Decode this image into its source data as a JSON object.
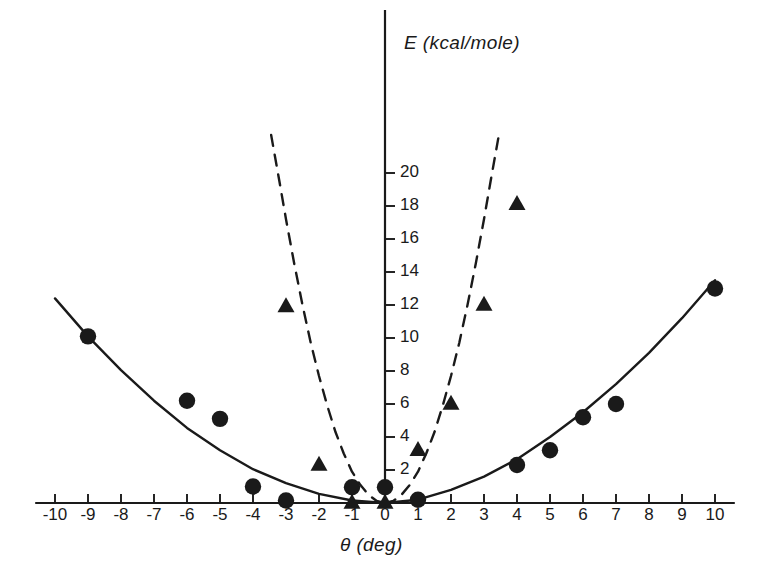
{
  "chart_data": {
    "type": "scatter",
    "title": "",
    "xlabel": "θ (deg)",
    "ylabel": "E (kcal/mole)",
    "xlim": [
      -10.6,
      10.6
    ],
    "ylim": [
      0,
      22.5
    ],
    "grid": false,
    "legend_position": "none",
    "x_ticks": [
      -10,
      -9,
      -8,
      -7,
      -6,
      -5,
      -4,
      -3,
      -2,
      -1,
      0,
      1,
      2,
      3,
      4,
      5,
      6,
      7,
      8,
      9,
      10
    ],
    "x_tick_labels": [
      "-10",
      "-9",
      "-8",
      "-7",
      "-6",
      "-5",
      "-4",
      "-3",
      "-2",
      "-1",
      "0",
      "1",
      "2",
      "3",
      "4",
      "5",
      "6",
      "7",
      "8",
      "9",
      "10"
    ],
    "y_ticks": [
      2,
      4,
      6,
      8,
      10,
      12,
      14,
      16,
      18,
      20
    ],
    "y_tick_labels": [
      "2",
      "4",
      "6",
      "8",
      "10",
      "12",
      "14",
      "16",
      "18",
      "20"
    ],
    "series": [
      {
        "name": "circles",
        "marker": "filled-circle",
        "color": "#1a1a1a",
        "points": [
          {
            "x": -9,
            "y": 10.1
          },
          {
            "x": -6,
            "y": 6.2
          },
          {
            "x": -5,
            "y": 5.1
          },
          {
            "x": -4,
            "y": 1.0
          },
          {
            "x": -3,
            "y": 0.15
          },
          {
            "x": -1,
            "y": 0.95
          },
          {
            "x": 0,
            "y": 0.95
          },
          {
            "x": 1,
            "y": 0.2
          },
          {
            "x": 4,
            "y": 2.3
          },
          {
            "x": 5,
            "y": 3.2
          },
          {
            "x": 6,
            "y": 5.2
          },
          {
            "x": 7,
            "y": 6.0
          },
          {
            "x": 10,
            "y": 13.0
          }
        ]
      },
      {
        "name": "triangles",
        "marker": "filled-triangle",
        "color": "#1a1a1a",
        "points": [
          {
            "x": -3,
            "y": 11.9
          },
          {
            "x": -2,
            "y": 2.3
          },
          {
            "x": -1,
            "y": 0.0
          },
          {
            "x": 0,
            "y": 0.0
          },
          {
            "x": 1,
            "y": 3.2
          },
          {
            "x": 2,
            "y": 6.0
          },
          {
            "x": 3,
            "y": 12.0
          },
          {
            "x": 4,
            "y": 18.1
          }
        ]
      },
      {
        "name": "solid-curve",
        "marker": "none",
        "line_style": "solid",
        "color": "#1a1a1a",
        "description": "broad quadratic fit through circle data",
        "points": [
          {
            "x": -10.0,
            "y": 12.4
          },
          {
            "x": -9.0,
            "y": 10.1
          },
          {
            "x": -8.0,
            "y": 8.05
          },
          {
            "x": -7.0,
            "y": 6.2
          },
          {
            "x": -6.0,
            "y": 4.55
          },
          {
            "x": -5.0,
            "y": 3.2
          },
          {
            "x": -4.0,
            "y": 2.05
          },
          {
            "x": -3.0,
            "y": 1.2
          },
          {
            "x": -2.0,
            "y": 0.55
          },
          {
            "x": -1.0,
            "y": 0.15
          },
          {
            "x": 0.0,
            "y": 0.0
          },
          {
            "x": 1.0,
            "y": 0.2
          },
          {
            "x": 2.0,
            "y": 0.8
          },
          {
            "x": 3.0,
            "y": 1.6
          },
          {
            "x": 4.0,
            "y": 2.65
          },
          {
            "x": 5.0,
            "y": 4.0
          },
          {
            "x": 6.0,
            "y": 5.5
          },
          {
            "x": 7.0,
            "y": 7.2
          },
          {
            "x": 8.0,
            "y": 9.1
          },
          {
            "x": 9.0,
            "y": 11.2
          },
          {
            "x": 10.0,
            "y": 13.5
          }
        ]
      },
      {
        "name": "dashed-curve-left",
        "marker": "none",
        "line_style": "dashed",
        "color": "#1a1a1a",
        "description": "steep quadratic through triangle data, negative branch",
        "points": [
          {
            "x": -3.45,
            "y": 22.3
          },
          {
            "x": -3.2,
            "y": 19.5
          },
          {
            "x": -3.0,
            "y": 17.2
          },
          {
            "x": -2.75,
            "y": 14.5
          },
          {
            "x": -2.5,
            "y": 12.0
          },
          {
            "x": -2.25,
            "y": 9.7
          },
          {
            "x": -2.0,
            "y": 7.7
          },
          {
            "x": -1.75,
            "y": 5.9
          },
          {
            "x": -1.5,
            "y": 4.3
          },
          {
            "x": -1.25,
            "y": 3.0
          },
          {
            "x": -1.0,
            "y": 1.9
          },
          {
            "x": -0.75,
            "y": 1.1
          },
          {
            "x": -0.5,
            "y": 0.5
          },
          {
            "x": -0.25,
            "y": 0.12
          },
          {
            "x": 0.0,
            "y": 0.0
          }
        ]
      },
      {
        "name": "dashed-curve-right",
        "marker": "none",
        "line_style": "dashed",
        "color": "#1a1a1a",
        "description": "steep quadratic through triangle data, positive branch",
        "points": [
          {
            "x": 0.0,
            "y": 0.0
          },
          {
            "x": 0.25,
            "y": 0.12
          },
          {
            "x": 0.5,
            "y": 0.5
          },
          {
            "x": 0.75,
            "y": 1.1
          },
          {
            "x": 1.0,
            "y": 1.9
          },
          {
            "x": 1.25,
            "y": 3.0
          },
          {
            "x": 1.5,
            "y": 4.3
          },
          {
            "x": 1.75,
            "y": 5.9
          },
          {
            "x": 2.0,
            "y": 7.7
          },
          {
            "x": 2.25,
            "y": 9.7
          },
          {
            "x": 2.5,
            "y": 12.0
          },
          {
            "x": 2.75,
            "y": 14.5
          },
          {
            "x": 3.0,
            "y": 17.2
          },
          {
            "x": 3.2,
            "y": 19.5
          },
          {
            "x": 3.45,
            "y": 22.3
          }
        ]
      }
    ]
  },
  "axes": {
    "y_axis_label": "E (kcal/mole)",
    "x_axis_label": "θ (deg)"
  }
}
